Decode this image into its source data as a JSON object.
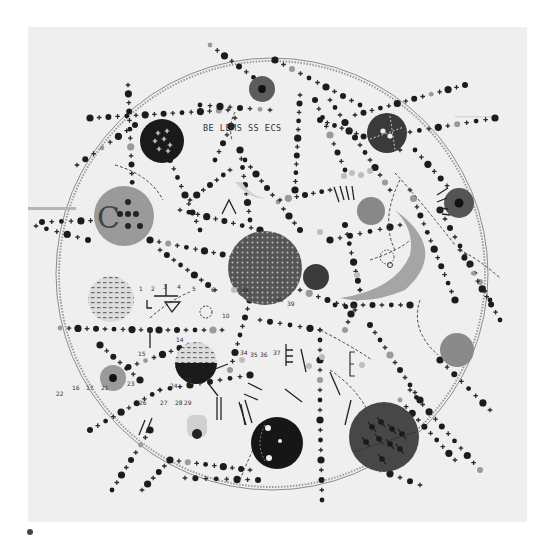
{
  "artwork": {
    "description": "Grayscale abstract cosmic painting: a large thin circle filled with chains of black dots and crosses radiating outward, with several disc 'planets', a crescent, and a textured central sphere.",
    "inscription": "BE LEMS SS ECS",
    "numerals": [
      "1",
      "2",
      "3",
      "4",
      "5",
      "6",
      "10",
      "14",
      "15",
      "16",
      "17",
      "21",
      "22",
      "23",
      "24",
      "25",
      "26",
      "27",
      "28",
      "29",
      "34",
      "35",
      "36",
      "37",
      "38",
      "39",
      "40"
    ],
    "colors": {
      "background": "#ffffff",
      "paper": "#efefef",
      "ink": "#1c1c1c",
      "dark_disc": "#2a2a2a",
      "mid_disc": "#6e6e6e",
      "light_disc": "#a9a9a9",
      "pale": "#c8c8c8"
    },
    "paper_bounds": {
      "x": 28,
      "y": 27,
      "width": 499,
      "height": 495
    },
    "orbit": {
      "cx": 272,
      "cy": 274,
      "r": 216
    },
    "discs": [
      {
        "name": "central-sphere",
        "cx": 265,
        "cy": 268,
        "r": 37,
        "fill": "#5a5a5a",
        "texture": "dotted"
      },
      {
        "name": "small-dark-planet-center",
        "cx": 316,
        "cy": 277,
        "r": 13,
        "fill": "#3a3a3a"
      },
      {
        "name": "top-left-black-disc",
        "cx": 162,
        "cy": 141,
        "r": 22,
        "fill": "#1a1a1a",
        "marks": "crosses"
      },
      {
        "name": "top-red-disc",
        "cx": 262,
        "cy": 89,
        "r": 13,
        "fill": "#5c5c5c",
        "core": true
      },
      {
        "name": "top-right-dark-disc",
        "cx": 387,
        "cy": 133,
        "r": 20,
        "fill": "#3a3a3a",
        "marks": "dashed-cross"
      },
      {
        "name": "left-large-grey-disc",
        "cx": 124,
        "cy": 216,
        "r": 30,
        "fill": "#9a9a9a",
        "marks": "C"
      },
      {
        "name": "right-dark-star-disc",
        "cx": 459,
        "cy": 203,
        "r": 15,
        "fill": "#555555",
        "core": true
      },
      {
        "name": "mid-right-grey-disc",
        "cx": 371,
        "cy": 211,
        "r": 14,
        "fill": "#888888"
      },
      {
        "name": "left-striped-disc",
        "cx": 111,
        "cy": 299,
        "r": 23,
        "fill": "#d8d8d8",
        "texture": "dashes"
      },
      {
        "name": "left-small-grey-disc",
        "cx": 113,
        "cy": 378,
        "r": 13,
        "fill": "#9a9a9a",
        "core": true
      },
      {
        "name": "half-black-disc",
        "cx": 196,
        "cy": 363,
        "r": 21,
        "fill": "#1a1a1a",
        "half": true
      },
      {
        "name": "right-grey-disc",
        "cx": 457,
        "cy": 350,
        "r": 17,
        "fill": "#8a8a8a"
      },
      {
        "name": "bottom-black-disc",
        "cx": 277,
        "cy": 443,
        "r": 26,
        "fill": "#161616",
        "marks": "moons"
      },
      {
        "name": "bottom-right-big-disc",
        "cx": 384,
        "cy": 437,
        "r": 35,
        "fill": "#474747",
        "marks": "arrows"
      }
    ],
    "signature_dot": {
      "cx": 30,
      "cy": 532,
      "r": 3
    }
  }
}
